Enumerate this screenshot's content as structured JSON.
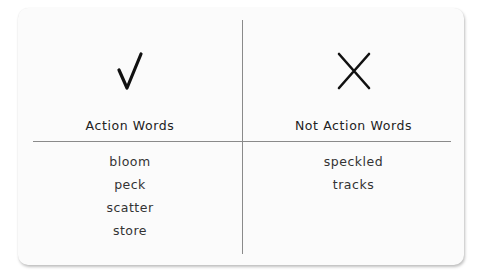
{
  "chart": {
    "columns": [
      {
        "icon": "check-mark-icon",
        "heading": "Action Words",
        "words": [
          "bloom",
          "peck",
          "scatter",
          "store"
        ]
      },
      {
        "icon": "x-mark-icon",
        "heading": "Not Action Words",
        "words": [
          "speckled",
          "tracks"
        ]
      }
    ]
  },
  "colors": {
    "ink": "#111111",
    "divider": "#8a8a8a",
    "card": "#fbfbfb"
  }
}
